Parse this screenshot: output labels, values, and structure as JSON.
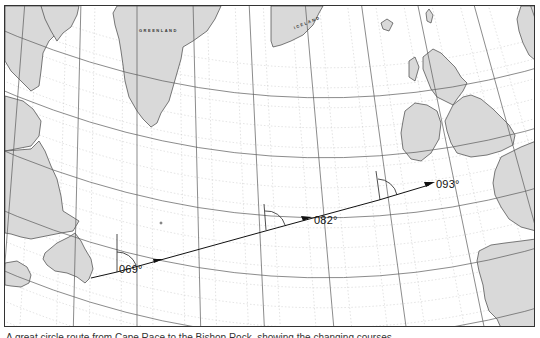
{
  "map": {
    "title": "North Atlantic great circle route chart",
    "labels": {
      "greenland": "GREENLAND",
      "iceland": "ICELAND"
    },
    "bearings": [
      {
        "label": "069°",
        "x": 118,
        "y": 262
      },
      {
        "label": "082°",
        "x": 313,
        "y": 213
      },
      {
        "label": "093°",
        "x": 434,
        "y": 177
      }
    ],
    "route": {
      "points": [
        [
          90,
          277
        ],
        [
          116,
          271
        ],
        [
          268,
          229
        ],
        [
          378,
          199
        ],
        [
          428,
          184
        ]
      ],
      "color": "#111111"
    },
    "colors": {
      "land": "#d9d9d9",
      "coast": "#444444",
      "graticule_major": "#555555",
      "graticule_minor": "#bdbdbd",
      "frame": "#333333"
    }
  },
  "caption": {
    "text": "A great circle route from Cape Race to the Bishop Rock, showing the changing courses."
  }
}
